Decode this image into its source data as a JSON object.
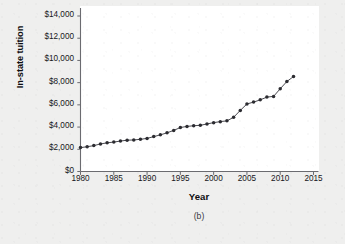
{
  "figure": {
    "caption": "(b)",
    "background_color": "#efefee",
    "panel_color": "#ffffff",
    "axis_color": "#6b6b70",
    "marker_color": "#2b2b30",
    "line_color": "#4a4a50"
  },
  "chart_data": {
    "type": "line",
    "title": "",
    "subtitle": "",
    "xlabel": "Year",
    "ylabel": "In-state tuition",
    "xlim": [
      1980,
      2015
    ],
    "ylim": [
      0,
      14000
    ],
    "grid": false,
    "legend": null,
    "xticks": [
      1980,
      1985,
      1990,
      1995,
      2000,
      2005,
      2010,
      2015
    ],
    "xtick_labels": [
      "1980",
      "1985",
      "1990",
      "1995",
      "2000",
      "2005",
      "2010",
      "2015"
    ],
    "yticks": [
      0,
      2000,
      4000,
      6000,
      8000,
      10000,
      12000,
      14000
    ],
    "ytick_labels": [
      "$0",
      "$2,000",
      "$4,000",
      "$6,000",
      "$8,000",
      "$10,000",
      "$12,000",
      "$14,000"
    ],
    "marker": "circle",
    "x": [
      1980,
      1981,
      1982,
      1983,
      1984,
      1985,
      1986,
      1987,
      1988,
      1989,
      1990,
      1991,
      1992,
      1993,
      1994,
      1995,
      1996,
      1997,
      1998,
      1999,
      2000,
      2001,
      2002,
      2003,
      2004,
      2005,
      2006,
      2007,
      2008,
      2009,
      2010,
      2011,
      2012
    ],
    "values": [
      2150,
      2230,
      2330,
      2480,
      2580,
      2650,
      2740,
      2820,
      2840,
      2900,
      2980,
      3140,
      3300,
      3480,
      3700,
      3960,
      4060,
      4120,
      4160,
      4280,
      4400,
      4490,
      4560,
      4880,
      5500,
      6080,
      6250,
      6450,
      6700,
      6760,
      7450,
      8100,
      8550
    ],
    "annotations": []
  }
}
